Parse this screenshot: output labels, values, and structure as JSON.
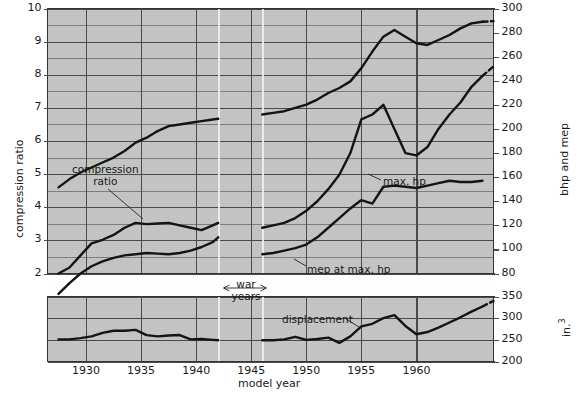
{
  "figure": {
    "kind": "multi-panel-line-chart",
    "background": "#ffffff",
    "plot_background": "#c4c4c4",
    "line_color": "#141414",
    "grid_color": "#7d7d7d"
  },
  "axes": {
    "x": {
      "label": "model year",
      "ticks": [
        "1930",
        "1935",
        "1940",
        "1945",
        "1950",
        "1955",
        "1960"
      ],
      "tick_values": [
        1930,
        1935,
        1940,
        1945,
        1950,
        1955,
        1960
      ],
      "range": [
        1926.5,
        1967
      ]
    },
    "y_left": {
      "label": "compression ratio",
      "ticks": [
        "10",
        "9",
        "8",
        "7",
        "6",
        "5",
        "4",
        "3",
        "2"
      ],
      "tick_values": [
        10,
        9,
        8,
        7,
        6,
        5,
        4,
        3,
        2
      ],
      "range": [
        2,
        10
      ]
    },
    "y_right_upper": {
      "label": "bhp and mep",
      "ticks": [
        "300",
        "280",
        "260",
        "240",
        "220",
        "200",
        "180",
        "160",
        "140",
        "120",
        "100",
        "80"
      ],
      "tick_values": [
        300,
        280,
        260,
        240,
        220,
        200,
        180,
        160,
        140,
        120,
        100,
        80
      ],
      "range": [
        80,
        300
      ]
    },
    "y_right_lower": {
      "label": "in.³",
      "ticks": [
        "350",
        "300",
        "250",
        "200"
      ],
      "tick_values": [
        350,
        300,
        250,
        200
      ],
      "range": [
        200,
        350
      ]
    }
  },
  "annotations": [
    {
      "id": "compression-ratio",
      "text_line1": "compression",
      "text_line2": "ratio"
    },
    {
      "id": "max-hp",
      "text": "max. hp"
    },
    {
      "id": "mep-at-max-hp",
      "text": "mep at max. hp"
    },
    {
      "id": "displacement",
      "text": "displacement"
    },
    {
      "id": "war-years",
      "text_line1": "war",
      "text_line2": "years"
    }
  ],
  "chart_data": {
    "type": "line",
    "title": "",
    "xlabel": "model year",
    "ylabel": "compression ratio",
    "ylabel_right_upper": "bhp and mep",
    "ylabel_right_lower": "in.³",
    "xlim": [
      1926.5,
      1967
    ],
    "ylim_left": [
      2,
      10
    ],
    "ylim_right_upper": [
      80,
      300
    ],
    "ylim_right_lower": [
      200,
      350
    ],
    "grid": true,
    "legend": "inline-annotations",
    "series": [
      {
        "name": "compression ratio",
        "axis": "y_left",
        "units": "ratio",
        "annotation": "compression ratio",
        "segments": [
          {
            "x": [
              1927.5,
              1928.5,
              1929.5,
              1930.5,
              1931.5,
              1932.5,
              1933.5,
              1934.5,
              1935.5,
              1936.5
            ],
            "y": [
              4.6,
              4.85,
              5.05,
              5.2,
              5.35,
              5.5,
              5.7,
              5.95,
              6.1,
              6.3
            ]
          },
          {
            "x": [
              1936.5,
              1937.5,
              1938.5,
              1939.5,
              1940.5,
              1941.5,
              1942.0
            ],
            "y": [
              6.3,
              6.45,
              6.5,
              6.55,
              6.6,
              6.65,
              6.67
            ]
          },
          {
            "x": [
              1946.0,
              1947.0,
              1948.0,
              1949.0,
              1950.0,
              1951.0,
              1952.0,
              1953.0,
              1954.0,
              1955.0,
              1956.0,
              1957.0,
              1958.0,
              1959.0,
              1960.0,
              1961.0,
              1962.0,
              1963.0,
              1964.0,
              1965.0,
              1966.0
            ],
            "y": [
              6.8,
              6.85,
              6.9,
              7.0,
              7.1,
              7.25,
              7.45,
              7.6,
              7.8,
              8.2,
              8.7,
              9.15,
              9.35,
              9.15,
              8.95,
              8.9,
              9.05,
              9.2,
              9.4,
              9.55,
              9.6
            ]
          },
          {
            "x": [
              1966.0,
              1967.0
            ],
            "y": [
              9.6,
              9.62
            ],
            "style": "dashed"
          }
        ]
      },
      {
        "name": "max. hp",
        "axis": "y_right_upper",
        "units": "bhp",
        "annotation": "max. hp",
        "segments": [
          {
            "x": [
              1927.5,
              1928.5,
              1929.5,
              1930.5,
              1931.5,
              1932.5,
              1933.5,
              1934.5,
              1935.5,
              1936.5,
              1937.5,
              1938.5,
              1939.5,
              1940.5,
              1941.5,
              1942.0
            ],
            "y": [
              80.0,
              85.0,
              95.0,
              105.0,
              108.0,
              112.0,
              118.0,
              122.0,
              121.0,
              121.5,
              122.0,
              120.0,
              118.0,
              116.0,
              120.0,
              122.0
            ]
          },
          {
            "x": [
              1946.0,
              1947.0,
              1948.0,
              1949.0,
              1950.0,
              1951.0,
              1952.0,
              1953.0,
              1954.0,
              1955.0,
              1956.0,
              1957.0,
              1958.0,
              1959.0,
              1960.0,
              1961.0,
              1962.0,
              1963.0,
              1964.0,
              1965.0,
              1966.0
            ],
            "y": [
              118.0,
              120.0,
              122.0,
              126.0,
              132.0,
              140.0,
              150.0,
              162.0,
              180.0,
              208.0,
              212.0,
              220.0,
              200.0,
              180.0,
              178.0,
              185.0,
              200.0,
              212.0,
              222.0,
              235.0,
              244.0
            ]
          },
          {
            "x": [
              1966.0,
              1967.0
            ],
            "y": [
              244.0,
              252.0
            ],
            "style": "dashed"
          }
        ]
      },
      {
        "name": "mep at max. hp",
        "axis": "y_right_upper",
        "units": "mep",
        "annotation": "mep at max. hp",
        "segments": [
          {
            "x": [
              1927.5,
              1928.5,
              1929.5,
              1930.5,
              1931.5,
              1932.5,
              1933.5,
              1934.5,
              1935.5,
              1936.5,
              1937.5,
              1938.5,
              1939.5,
              1940.5,
              1941.5,
              1942.0
            ],
            "y": [
              63.0,
              72.0,
              80.0,
              86.0,
              90.0,
              93.0,
              95.0,
              96.0,
              97.0,
              96.5,
              96.0,
              97.0,
              99.0,
              102.0,
              106.0,
              110.0
            ]
          },
          {
            "x": [
              1946.0,
              1947.0,
              1948.0,
              1949.0,
              1950.0,
              1951.0,
              1952.0,
              1953.0,
              1954.0,
              1955.0,
              1956.0,
              1957.0,
              1958.0,
              1959.0,
              1960.0,
              1961.0,
              1962.0,
              1963.0,
              1964.0,
              1965.0,
              1966.0
            ],
            "y": [
              96.0,
              97.0,
              99.0,
              101.0,
              104.0,
              110.0,
              118.0,
              126.0,
              134.0,
              141.0,
              138.0,
              152.0,
              153.0,
              152.0,
              151.0,
              153.0,
              155.0,
              157.0,
              156.0,
              156.0,
              157.0
            ]
          }
        ]
      },
      {
        "name": "displacement",
        "axis": "y_right_lower",
        "units": "in.³",
        "annotation": "displacement",
        "segments": [
          {
            "x": [
              1927.5,
              1928.5,
              1929.5,
              1930.5,
              1931.5,
              1932.5,
              1933.5,
              1934.5,
              1935.5,
              1936.5,
              1937.5,
              1938.5,
              1939.5,
              1940.5,
              1941.5,
              1942.0
            ],
            "y": [
              251.0,
              251.0,
              254.0,
              258.0,
              266.0,
              271.0,
              271.0,
              273.0,
              261.0,
              258.0,
              260.0,
              261.0,
              251.0,
              252.0,
              250.0,
              249.0
            ]
          },
          {
            "x": [
              1946.0,
              1947.0,
              1948.0,
              1949.0,
              1950.0,
              1951.0,
              1952.0,
              1953.0,
              1954.0,
              1955.0,
              1956.0,
              1957.0,
              1958.0,
              1959.0,
              1960.0,
              1961.0,
              1962.0,
              1963.0,
              1964.0,
              1965.0,
              1966.0
            ],
            "y": [
              249.0,
              249.0,
              251.0,
              257.0,
              250.0,
              252.0,
              255.0,
              243.0,
              258.0,
              281.0,
              287.0,
              300.0,
              307.0,
              282.0,
              263.0,
              268.0,
              278.0,
              290.0,
              302.0,
              315.0,
              327.0
            ]
          },
          {
            "x": [
              1966.0,
              1967.0
            ],
            "y": [
              327.0,
              340.0
            ],
            "style": "dashed"
          }
        ]
      }
    ]
  }
}
